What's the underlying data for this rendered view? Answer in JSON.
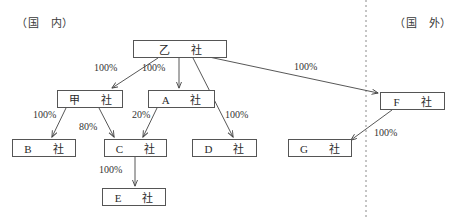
{
  "regions": {
    "domestic": "（国　内）",
    "overseas": "（国　外）"
  },
  "divider": {
    "name": "domestic-overseas-divider",
    "style": "dashed-vertical",
    "x": 366,
    "color": "#8a8a8a"
  },
  "nodes": [
    {
      "id": "otsu",
      "label": "乙　社",
      "x": 133,
      "y": 40,
      "w": 94,
      "h": 18
    },
    {
      "id": "kou",
      "label": "甲　社",
      "x": 57,
      "y": 90,
      "w": 66,
      "h": 18
    },
    {
      "id": "a",
      "label": "A　社",
      "x": 148,
      "y": 90,
      "w": 67,
      "h": 18
    },
    {
      "id": "f",
      "label": "F　社",
      "x": 380,
      "y": 92,
      "w": 65,
      "h": 18
    },
    {
      "id": "b",
      "label": "B　社",
      "x": 12,
      "y": 139,
      "w": 64,
      "h": 18
    },
    {
      "id": "c",
      "label": "C　社",
      "x": 104,
      "y": 139,
      "w": 63,
      "h": 18
    },
    {
      "id": "d",
      "label": "D　社",
      "x": 192,
      "y": 139,
      "w": 65,
      "h": 18
    },
    {
      "id": "g",
      "label": "G　社",
      "x": 288,
      "y": 139,
      "w": 64,
      "h": 18
    },
    {
      "id": "e",
      "label": "E　社",
      "x": 102,
      "y": 188,
      "w": 64,
      "h": 18
    }
  ],
  "edges": [
    {
      "id": "otsu-kou",
      "from": "otsu",
      "to": "kou",
      "label": "100%",
      "lx": 94,
      "ly": 62
    },
    {
      "id": "otsu-a",
      "from": "otsu",
      "to": "a",
      "label": "100%",
      "lx": 142,
      "ly": 62
    },
    {
      "id": "otsu-d",
      "from": "otsu",
      "to": "d",
      "label": "100%",
      "lx": 225,
      "ly": 109
    },
    {
      "id": "otsu-f",
      "from": "otsu",
      "to": "f",
      "label": "100%",
      "lx": 294,
      "ly": 61
    },
    {
      "id": "kou-b",
      "from": "kou",
      "to": "b",
      "label": "100%",
      "lx": 33,
      "ly": 109
    },
    {
      "id": "kou-c",
      "from": "kou",
      "to": "c",
      "label": "80%",
      "lx": 79,
      "ly": 121
    },
    {
      "id": "a-c",
      "from": "a",
      "to": "c",
      "label": "20%",
      "lx": 132,
      "ly": 109
    },
    {
      "id": "c-e",
      "from": "c",
      "to": "e",
      "label": "100%",
      "lx": 99,
      "ly": 164
    },
    {
      "id": "f-g",
      "from": "f",
      "to": "g",
      "label": "100%",
      "lx": 374,
      "ly": 127
    }
  ],
  "colors": {
    "box_border": "#555555",
    "line": "#444444",
    "text": "#2b2b2b",
    "divider": "#8a8a8a"
  }
}
